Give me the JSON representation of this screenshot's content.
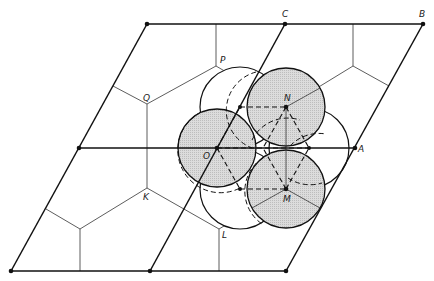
{
  "diagram": {
    "colors": {
      "line": "#111111",
      "thin_line": "#333333",
      "shade": "#d4d4d4",
      "background": "#ffffff"
    },
    "labels": {
      "A": "A",
      "B": "B",
      "C": "C",
      "O": "O",
      "N": "N",
      "M": "M",
      "P": "P",
      "Q": "Q",
      "K": "K",
      "L": "L"
    }
  }
}
